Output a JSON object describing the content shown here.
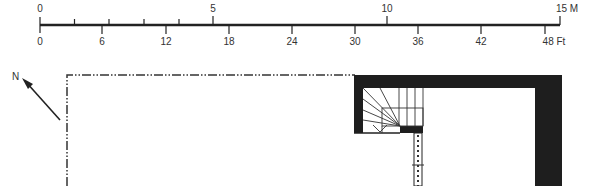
{
  "scale_bar": {
    "metric": {
      "unit": "M",
      "labels": [
        {
          "text": "0",
          "x": 40
        },
        {
          "text": "5",
          "x": 213
        },
        {
          "text": "10",
          "x": 387
        },
        {
          "text": "15 M",
          "x": 565
        }
      ]
    },
    "imperial": {
      "unit": "Ft",
      "labels": [
        {
          "text": "0",
          "x": 40
        },
        {
          "text": "6",
          "x": 102
        },
        {
          "text": "12",
          "x": 166
        },
        {
          "text": "18",
          "x": 229
        },
        {
          "text": "24",
          "x": 292
        },
        {
          "text": "30",
          "x": 355
        },
        {
          "text": "36",
          "x": 418
        },
        {
          "text": "42",
          "x": 481
        },
        {
          "text": "48 Ft",
          "x": 552
        }
      ]
    }
  },
  "north_arrow": {
    "label": "N"
  },
  "colors": {
    "ink": "#1e1e1e",
    "paper": "#ffffff"
  }
}
